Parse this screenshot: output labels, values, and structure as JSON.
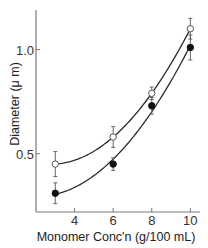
{
  "chart_data": {
    "type": "scatter",
    "title": "",
    "xlabel": "Monomer Conc'n (g/100 mL)",
    "ylabel": "Diameter (μ m)",
    "xlim": [
      2.0,
      10.5
    ],
    "ylim": [
      0.22,
      1.19
    ],
    "xticks": [
      4,
      6,
      8,
      10
    ],
    "xtick_labels": [
      "4",
      "6",
      "8",
      "10"
    ],
    "yticks": [
      0.5,
      1.0
    ],
    "ytick_labels": [
      "0.5",
      "1.0"
    ],
    "grid": false,
    "legend": null,
    "series": [
      {
        "name": "open-circles",
        "marker": "open-circle",
        "color": "#2a2a2a",
        "x": [
          3,
          6,
          8,
          10
        ],
        "y": [
          0.45,
          0.58,
          0.79,
          1.1
        ],
        "yerr": [
          0.06,
          0.05,
          0.03,
          0.05
        ],
        "fit_curve": true
      },
      {
        "name": "filled-circles",
        "marker": "filled-circle",
        "color": "#111111",
        "x": [
          3,
          6,
          8,
          10
        ],
        "y": [
          0.31,
          0.45,
          0.73,
          1.01
        ],
        "yerr": [
          0.05,
          0.03,
          0.04,
          0.06
        ],
        "fit_curve": true
      }
    ]
  }
}
